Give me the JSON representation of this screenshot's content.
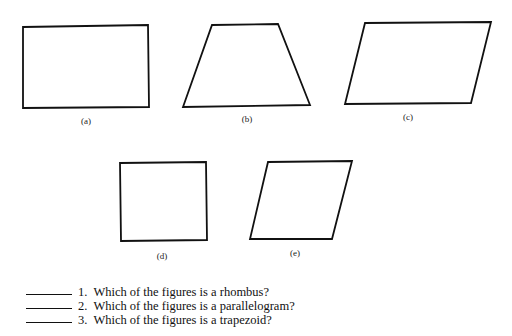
{
  "figures": [
    {
      "id": "a",
      "label": "(a)",
      "shape": "rectangle",
      "points": "23,27 148,25 149,107 23,108",
      "label_pos": [
        86,
        116
      ]
    },
    {
      "id": "b",
      "label": "(b)",
      "shape": "trapezoid",
      "points": "212,25 278,24 310,105 183,107",
      "label_pos": [
        247,
        114
      ]
    },
    {
      "id": "c",
      "label": "(c)",
      "shape": "parallelogram",
      "points": "365,23 491,22 471,103 345,104",
      "label_pos": [
        408,
        112
      ]
    },
    {
      "id": "d",
      "label": "(d)",
      "shape": "square",
      "points": "120,163 206,162 207,240 121,241",
      "label_pos": [
        162,
        251
      ]
    },
    {
      "id": "e",
      "label": "(e)",
      "shape": "rhombus",
      "points": "268,162 352,161 332,239 250,239",
      "label_pos": [
        295,
        248
      ]
    }
  ],
  "questions": [
    {
      "number": "1.",
      "text": "Which of the figures is a rhombus?",
      "answer": ""
    },
    {
      "number": "2.",
      "text": "Which of the figures is a parallelogram?",
      "answer": ""
    },
    {
      "number": "3.",
      "text": "Which of the figures is a trapezoid?",
      "answer": ""
    }
  ],
  "colors": {
    "stroke": "#111111",
    "background": "#ffffff"
  }
}
